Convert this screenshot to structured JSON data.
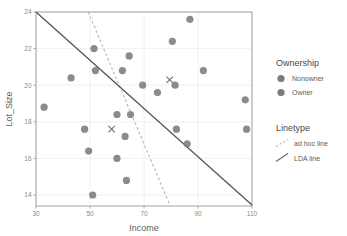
{
  "chart_data": {
    "type": "scatter",
    "title": "",
    "xlabel": "Income",
    "ylabel": "Lot_Size",
    "xlim": [
      30,
      110
    ],
    "ylim": [
      13.4,
      24
    ],
    "xticks": [
      30,
      50,
      70,
      90,
      110
    ],
    "yticks": [
      14,
      16,
      18,
      20,
      22,
      24
    ],
    "grid": true,
    "legend_position": "right",
    "point_color": "#7b7b7b",
    "line_color": "#555555",
    "dash_color": "#b4b4b4",
    "grid_color": "#ececec",
    "panel_border_color": "#9a9a9a",
    "series": [
      {
        "name": "Nonowner",
        "marker": "circle",
        "points": [
          {
            "x": 33.0,
            "y": 18.8
          },
          {
            "x": 43.0,
            "y": 20.4
          },
          {
            "x": 48.0,
            "y": 17.6
          },
          {
            "x": 49.5,
            "y": 16.4
          },
          {
            "x": 51.0,
            "y": 14.0
          },
          {
            "x": 60.0,
            "y": 18.4
          },
          {
            "x": 60.0,
            "y": 16.0
          },
          {
            "x": 63.0,
            "y": 17.2
          },
          {
            "x": 63.5,
            "y": 14.8
          },
          {
            "x": 65.0,
            "y": 18.4
          },
          {
            "x": 82.0,
            "y": 17.6
          },
          {
            "x": 86.0,
            "y": 16.8
          },
          {
            "x": 108.0,
            "y": 17.6
          }
        ]
      },
      {
        "name": "Owner",
        "marker": "circle",
        "points": [
          {
            "x": 51.5,
            "y": 22.0
          },
          {
            "x": 52.0,
            "y": 20.8
          },
          {
            "x": 62.0,
            "y": 20.8
          },
          {
            "x": 64.5,
            "y": 21.6
          },
          {
            "x": 69.5,
            "y": 20.0
          },
          {
            "x": 75.0,
            "y": 19.6
          },
          {
            "x": 80.5,
            "y": 22.4
          },
          {
            "x": 81.5,
            "y": 20.0
          },
          {
            "x": 87.0,
            "y": 23.6
          },
          {
            "x": 92.0,
            "y": 20.8
          },
          {
            "x": 107.5,
            "y": 19.2
          }
        ]
      },
      {
        "name": "centroid-markers",
        "marker": "x",
        "points": [
          {
            "x": 58.0,
            "y": 17.6
          },
          {
            "x": 79.5,
            "y": 20.3
          }
        ]
      }
    ],
    "lines": [
      {
        "name": "ad hoc line",
        "style": "dashed",
        "x1": 49.3,
        "y1": 24.0,
        "x2": 79.6,
        "y2": 13.45
      },
      {
        "name": "LDA line",
        "style": "solid",
        "x1": 30.0,
        "y1": 24.0,
        "x2": 110.0,
        "y2": 13.45
      }
    ]
  },
  "legend": {
    "ownership_title": "Ownership",
    "ownership_items": [
      {
        "label": "Nonowner"
      },
      {
        "label": "Owner"
      }
    ],
    "linetype_title": "Linetype",
    "linetype_items": [
      {
        "label": "ad hoc line"
      },
      {
        "label": "LDA line"
      }
    ]
  },
  "axis": {
    "x_title": "Income",
    "y_title": "Lot_Size",
    "x_tick_labels": [
      "30",
      "50",
      "70",
      "90",
      "110"
    ],
    "y_tick_labels": [
      "14",
      "16",
      "18",
      "20",
      "22",
      "24"
    ]
  }
}
